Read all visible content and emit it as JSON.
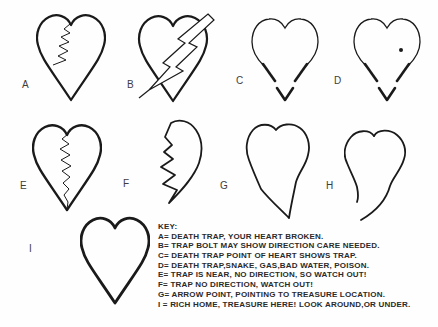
{
  "diagram": {
    "title_hidden": "",
    "figures": [
      {
        "id": "A",
        "label": "A",
        "meaning": "death trap, your heart broken"
      },
      {
        "id": "B",
        "label": "B",
        "meaning": "trap bolt may show direction care needed"
      },
      {
        "id": "C",
        "label": "C",
        "meaning": "death trap point of heart shows trap"
      },
      {
        "id": "D",
        "label": "D",
        "meaning": "death trap, snake, gas, bad water, poison"
      },
      {
        "id": "E",
        "label": "E",
        "meaning": "trap is near, no direction, so watch out"
      },
      {
        "id": "F",
        "label": "F",
        "meaning": "trap no direction, watch out"
      },
      {
        "id": "G",
        "label": "G",
        "meaning": "arrow point, pointing to treasure location"
      },
      {
        "id": "H",
        "label": "H",
        "meaning": ""
      },
      {
        "id": "I",
        "label": "I",
        "meaning": "rich home, treasure here, look around or under"
      }
    ]
  },
  "key": {
    "title": "KEY:",
    "entries": [
      "A= DEATH TRAP, YOUR HEART BROKEN.",
      "B= TRAP BOLT MAY SHOW DIRECTION CARE NEEDED.",
      "C= DEATH TRAP POINT OF HEART SHOWS TRAP.",
      "D= DEATH TRAP,SNAKE, GAS,BAD WATER, POISON.",
      "E= TRAP IS NEAR, NO DIRECTION, SO WATCH OUT!",
      "F= TRAP NO DIRECTION, WATCH OUT!",
      "G= ARROW POINT, POINTING TO TREASURE LOCATION.",
      "I = RICH HOME, TREASURE HERE! LOOK AROUND,OR UNDER."
    ]
  },
  "colors": {
    "ink": "#1a1a1a",
    "label_text": "#3d3d3d",
    "background": "#fefefe"
  }
}
